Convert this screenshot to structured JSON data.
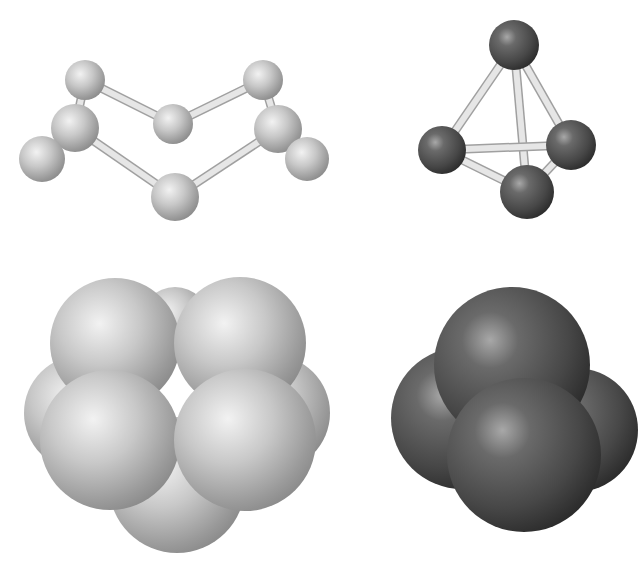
{
  "canvas": {
    "width": 644,
    "height": 582,
    "background": "#ffffff"
  },
  "colors": {
    "light_atom_hi": "#f2f2f2",
    "light_atom_mid": "#c4c4c4",
    "light_atom_lo": "#8a8a8a",
    "dark_atom_hi": "#a8a8a8",
    "dark_atom_mid": "#4e4e4e",
    "dark_atom_lo": "#2a2a2a",
    "bond_hi": "#f4f4f4",
    "bond_lo": "#b8b8b8"
  },
  "models": [
    {
      "id": "s8-ball-and-stick",
      "style": "ball-and-stick",
      "shade": "light",
      "atoms": [
        {
          "x": 85,
          "y": 80,
          "r": 20
        },
        {
          "x": 263,
          "y": 80,
          "r": 20
        },
        {
          "x": 173,
          "y": 124,
          "r": 20
        },
        {
          "x": 75,
          "y": 128,
          "r": 24
        },
        {
          "x": 278,
          "y": 129,
          "r": 24
        },
        {
          "x": 42,
          "y": 159,
          "r": 23
        },
        {
          "x": 307,
          "y": 159,
          "r": 22
        },
        {
          "x": 175,
          "y": 197,
          "r": 24
        }
      ],
      "bonds": [
        [
          0,
          2
        ],
        [
          2,
          1
        ],
        [
          0,
          3
        ],
        [
          1,
          4
        ],
        [
          3,
          5
        ],
        [
          4,
          6
        ],
        [
          3,
          7
        ],
        [
          7,
          4
        ]
      ]
    },
    {
      "id": "p4-ball-and-stick",
      "style": "ball-and-stick",
      "shade": "dark",
      "atoms": [
        {
          "x": 514,
          "y": 45,
          "r": 25
        },
        {
          "x": 442,
          "y": 150,
          "r": 24
        },
        {
          "x": 571,
          "y": 145,
          "r": 25
        },
        {
          "x": 527,
          "y": 192,
          "r": 27
        }
      ],
      "bonds": [
        [
          0,
          1
        ],
        [
          0,
          2
        ],
        [
          0,
          3
        ],
        [
          1,
          2
        ],
        [
          1,
          3
        ],
        [
          3,
          2
        ]
      ]
    },
    {
      "id": "s8-space-filling",
      "style": "space-filling",
      "shade": "light",
      "atoms": [
        {
          "x": 175,
          "y": 322,
          "r": 35
        },
        {
          "x": 82,
          "y": 413,
          "r": 58
        },
        {
          "x": 272,
          "y": 413,
          "r": 58
        },
        {
          "x": 177,
          "y": 485,
          "r": 68
        },
        {
          "x": 115,
          "y": 343,
          "r": 65
        },
        {
          "x": 240,
          "y": 343,
          "r": 66
        },
        {
          "x": 110,
          "y": 440,
          "r": 70
        },
        {
          "x": 245,
          "y": 440,
          "r": 71
        }
      ]
    },
    {
      "id": "p4-space-filling",
      "style": "space-filling",
      "shade": "dark",
      "atoms": [
        {
          "x": 576,
          "y": 430,
          "r": 62
        },
        {
          "x": 462,
          "y": 418,
          "r": 71
        },
        {
          "x": 512,
          "y": 365,
          "r": 78
        },
        {
          "x": 524,
          "y": 455,
          "r": 77
        }
      ]
    }
  ]
}
